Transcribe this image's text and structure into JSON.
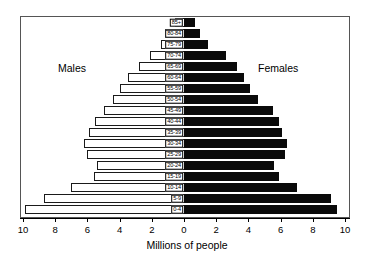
{
  "chart": {
    "type": "population-pyramid",
    "males_label": "Males",
    "females_label": "Females",
    "x_axis_title": "Millions of people"
  },
  "chart_data": {
    "type": "bar",
    "orientation": "horizontal-diverging",
    "title": "",
    "subtitle": "",
    "xlabel": "Millions of people",
    "ylabel": "",
    "xlim": [
      -10,
      10
    ],
    "xticks": [
      10,
      8,
      6,
      4,
      2,
      0,
      2,
      4,
      6,
      8,
      10
    ],
    "xtick_labels": [
      "10",
      "8",
      "6",
      "4",
      "2",
      "0",
      "2",
      "4",
      "6",
      "8",
      "10"
    ],
    "grid": false,
    "legend": [
      "Males",
      "Females"
    ],
    "legend_position": "inside-upper-left-and-right",
    "categories": [
      "0-4",
      "5-9",
      "10-14",
      "15-19",
      "20-24",
      "25-29",
      "30-34",
      "35-39",
      "40-44",
      "45-49",
      "50-54",
      "55-59",
      "60-64",
      "65-69",
      "70-74",
      "75-79",
      "80-84",
      "85+"
    ],
    "series": [
      {
        "name": "Males",
        "color": "#ffffff",
        "edge_color": "#1a1a1a",
        "direction": "left",
        "values": [
          9.9,
          8.7,
          7.0,
          5.6,
          5.4,
          6.0,
          6.2,
          5.9,
          5.5,
          5.0,
          4.4,
          4.0,
          3.5,
          2.8,
          2.1,
          1.4,
          1.2,
          0.55
        ]
      },
      {
        "name": "Females",
        "color": "#0a0a0a",
        "edge_color": "#0a0a0a",
        "direction": "right",
        "values": [
          9.5,
          9.1,
          7.0,
          5.9,
          5.6,
          6.3,
          6.4,
          6.1,
          5.9,
          5.5,
          4.6,
          4.1,
          3.7,
          3.3,
          2.6,
          1.5,
          1.0,
          0.7
        ]
      }
    ]
  },
  "colors": {
    "male_fill": "#ffffff",
    "female_fill": "#0a0a0a",
    "frame": "#555555",
    "axis": "#000000"
  }
}
